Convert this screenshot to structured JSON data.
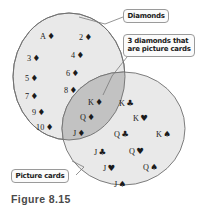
{
  "figure": {
    "caption": "Figure 8.15",
    "colors": {
      "circle_fill": "#e9e9e9",
      "intersection_fill": "#c2c2c2",
      "circle_stroke": "#6f6f6f",
      "label_border": "#9a9a9a",
      "label_fill": "#fbfbfb",
      "text": "#1b1b1b",
      "background": "#ffffff"
    }
  },
  "callouts": {
    "diamonds": "Diamonds",
    "intersection_line1": "3 diamonds that",
    "intersection_line2": "are picture cards",
    "picture_cards": "Picture cards"
  },
  "sets": {
    "diamonds_only": [
      {
        "rank": "A",
        "suit": "♦",
        "x": 40,
        "y": 32
      },
      {
        "rank": "2",
        "suit": "♦",
        "x": 79,
        "y": 33
      },
      {
        "rank": "3",
        "suit": "♦",
        "x": 27,
        "y": 54
      },
      {
        "rank": "4",
        "suit": "♦",
        "x": 71,
        "y": 51
      },
      {
        "rank": "5",
        "suit": "♦",
        "x": 25,
        "y": 74
      },
      {
        "rank": "6",
        "suit": "♦",
        "x": 66,
        "y": 69
      },
      {
        "rank": "7",
        "suit": "♦",
        "x": 25,
        "y": 92
      },
      {
        "rank": "8",
        "suit": "♦",
        "x": 64,
        "y": 86
      },
      {
        "rank": "9",
        "suit": "♦",
        "x": 32,
        "y": 108
      },
      {
        "rank": "10",
        "suit": "♦",
        "x": 36,
        "y": 123
      }
    ],
    "intersection": [
      {
        "rank": "K",
        "suit": "♦",
        "x": 88,
        "y": 98
      },
      {
        "rank": "Q",
        "suit": "♦",
        "x": 80,
        "y": 113
      },
      {
        "rank": "J",
        "suit": "♦",
        "x": 73,
        "y": 129
      },
      {
        "rank": "3 diamonds that are picture cards",
        "suit": "",
        "x": -999,
        "y": -999
      }
    ],
    "picture_cards_only": [
      {
        "rank": "K",
        "suit": "♣",
        "x": 119,
        "y": 99
      },
      {
        "rank": "K",
        "suit": "♥",
        "x": 133,
        "y": 114
      },
      {
        "rank": "Q",
        "suit": "♣",
        "x": 114,
        "y": 130
      },
      {
        "rank": "K",
        "suit": "♠",
        "x": 156,
        "y": 130
      },
      {
        "rank": "J",
        "suit": "♣",
        "x": 94,
        "y": 148
      },
      {
        "rank": "Q",
        "suit": "♥",
        "x": 129,
        "y": 147
      },
      {
        "rank": "J",
        "suit": "♥",
        "x": 103,
        "y": 164
      },
      {
        "rank": "Q",
        "suit": "♠",
        "x": 143,
        "y": 163
      },
      {
        "rank": "J",
        "suit": "♠",
        "x": 114,
        "y": 180
      }
    ]
  }
}
